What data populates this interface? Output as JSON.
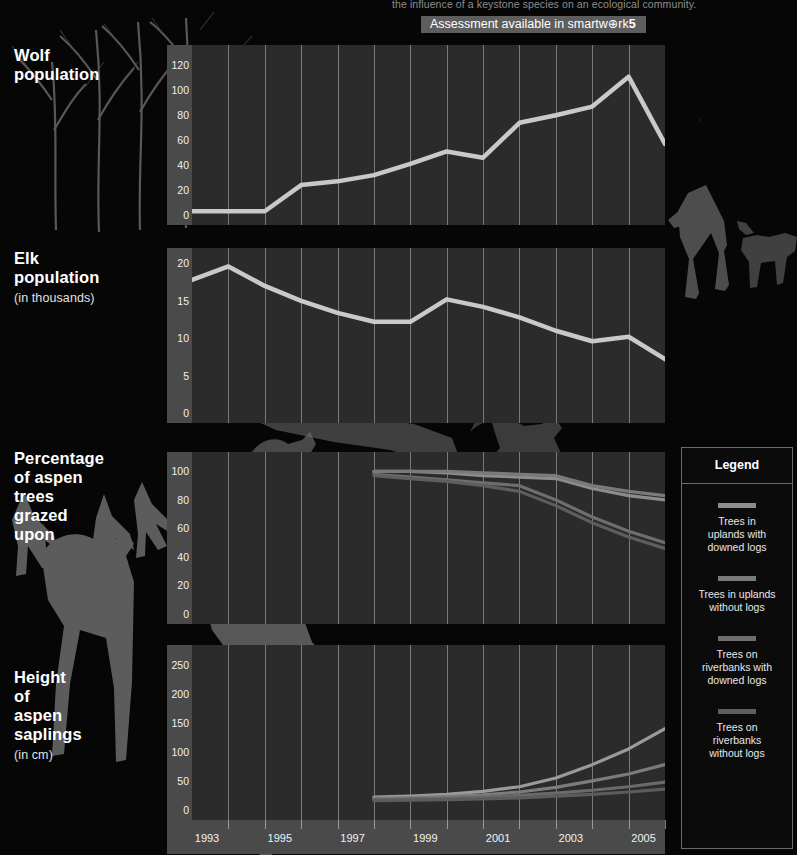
{
  "header": {
    "running_text": "the influence of a keystone species on an ecological community.",
    "badge_prefix": "Assessment available in smartw⊕rk",
    "badge_suffix": "5"
  },
  "xaxis": {
    "ticks": [
      1993,
      1994,
      1995,
      1996,
      1997,
      1998,
      1999,
      2000,
      2001,
      2002,
      2003,
      2004,
      2005,
      2006
    ],
    "labels": [
      "1993",
      "1995",
      "1997",
      "1999",
      "2001",
      "2003",
      "2005"
    ],
    "label_years": [
      1993,
      1995,
      1997,
      1999,
      2001,
      2003,
      2005
    ],
    "min": 1993,
    "max": 2006
  },
  "legend": {
    "title": "Legend",
    "items": [
      {
        "label": "Trees in\nuplands with\ndowned logs",
        "color": "#8c8c8c"
      },
      {
        "label": "Trees in uplands\nwithout logs",
        "color": "#7a7a7a"
      },
      {
        "label": "Trees on\nriverbanks with\ndowned logs",
        "color": "#6e6e6e"
      },
      {
        "label": "Trees on\nriverbanks\nwithout logs",
        "color": "#5e5e5e"
      }
    ]
  },
  "panels": [
    {
      "id": "wolf",
      "title": "Wolf population",
      "subtitle": ""
    },
    {
      "id": "elk",
      "title": "Elk population",
      "subtitle": "(in thousands)"
    },
    {
      "id": "grazed",
      "title": "Percentage\nof aspen trees\ngrazed upon",
      "subtitle": ""
    },
    {
      "id": "height",
      "title": "Height of\naspen saplings",
      "subtitle": "(in cm)"
    }
  ],
  "chart_data": [
    {
      "type": "line",
      "title": "Wolf population",
      "xlabel": "",
      "ylabel": "Wolf population",
      "ylim": [
        0,
        130
      ],
      "yticks": [
        0,
        20,
        40,
        60,
        80,
        100,
        120
      ],
      "grid": true,
      "line_color": "#c9c9c9",
      "x": [
        1993,
        1994,
        1995,
        1996,
        1997,
        1998,
        1999,
        2000,
        2001,
        2002,
        2003,
        2004,
        2005,
        2006
      ],
      "series": [
        {
          "name": "Wolf population",
          "values": [
            3,
            3,
            3,
            24,
            27,
            32,
            41,
            51,
            46,
            74,
            80,
            87,
            111,
            57
          ]
        }
      ]
    },
    {
      "type": "line",
      "title": "Elk population (in thousands)",
      "xlabel": "",
      "ylabel": "Elk population (thousands)",
      "ylim": [
        0,
        21
      ],
      "yticks": [
        0,
        5,
        10,
        15,
        20
      ],
      "grid": true,
      "line_color": "#c9c9c9",
      "x": [
        1993,
        1994,
        1995,
        1996,
        1997,
        1998,
        1999,
        2000,
        2001,
        2002,
        2003,
        2004,
        2005,
        2006
      ],
      "series": [
        {
          "name": "Elk population",
          "values": [
            17.8,
            19.6,
            17.0,
            15.0,
            13.4,
            12.2,
            12.2,
            15.2,
            14.2,
            12.8,
            11.0,
            9.6,
            10.2,
            7.2
          ]
        }
      ]
    },
    {
      "type": "line",
      "title": "Percentage of aspen trees grazed upon",
      "xlabel": "",
      "ylabel": "Percent grazed",
      "ylim": [
        0,
        108
      ],
      "yticks": [
        0,
        20,
        40,
        60,
        80,
        100
      ],
      "grid": true,
      "x": [
        1998,
        1999,
        2000,
        2001,
        2002,
        2003,
        2004,
        2005,
        2006
      ],
      "series": [
        {
          "name": "Trees in uplands with downed logs",
          "values": [
            100,
            100,
            99,
            97,
            96,
            95,
            88,
            83,
            80
          ],
          "color": "#8c8c8c"
        },
        {
          "name": "Trees in uplands without logs",
          "values": [
            100,
            100,
            100,
            99,
            98,
            97,
            90,
            86,
            83
          ],
          "color": "#7a7a7a"
        },
        {
          "name": "Trees on riverbanks with downed logs",
          "values": [
            98,
            96,
            94,
            92,
            90,
            80,
            68,
            58,
            50
          ],
          "color": "#6e6e6e"
        },
        {
          "name": "Trees on riverbanks without logs",
          "values": [
            97,
            95,
            93,
            90,
            86,
            76,
            64,
            54,
            46
          ],
          "color": "#5e5e5e"
        }
      ]
    },
    {
      "type": "line",
      "title": "Height of aspen saplings (in cm)",
      "xlabel": "",
      "ylabel": "Height (cm)",
      "ylim": [
        0,
        270
      ],
      "yticks": [
        0,
        50,
        100,
        150,
        200,
        250
      ],
      "grid": true,
      "x": [
        1998,
        1999,
        2000,
        2001,
        2002,
        2003,
        2004,
        2005,
        2006
      ],
      "series": [
        {
          "name": "Trees on riverbanks with downed logs",
          "values": [
            22,
            24,
            27,
            32,
            40,
            55,
            78,
            105,
            140
          ],
          "color": "#9a9a9a"
        },
        {
          "name": "Trees on riverbanks without logs",
          "values": [
            20,
            21,
            23,
            26,
            31,
            39,
            50,
            62,
            78
          ],
          "color": "#7c7c7c"
        },
        {
          "name": "Trees in uplands with downed logs",
          "values": [
            18,
            19,
            20,
            22,
            25,
            29,
            34,
            40,
            48
          ],
          "color": "#6a6a6a"
        },
        {
          "name": "Trees in uplands without logs",
          "values": [
            16,
            17,
            18,
            19,
            21,
            24,
            27,
            31,
            36
          ],
          "color": "#5c5c5c"
        }
      ]
    }
  ]
}
